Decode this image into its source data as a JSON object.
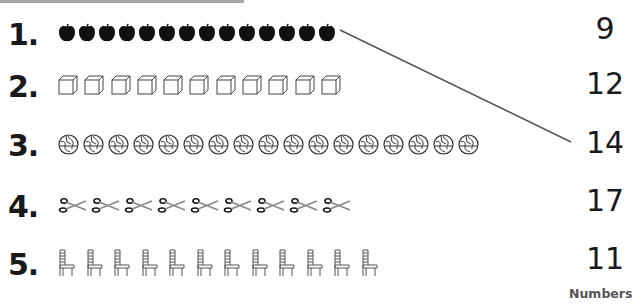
{
  "rows": [
    {
      "label": "1.",
      "object": "apple",
      "count": 14
    },
    {
      "label": "2.",
      "object": "cube",
      "count": 11
    },
    {
      "label": "3.",
      "object": "globe",
      "count": 17
    },
    {
      "label": "4.",
      "object": "scissors",
      "count": 9
    },
    {
      "label": "5.",
      "object": "chair",
      "count": 12
    }
  ],
  "answers": [
    "9",
    "12",
    "14",
    "17",
    "11"
  ],
  "footer_label": "Numbers",
  "matching_line": {
    "from_row": 1,
    "to_answer": "14",
    "color": "#555555"
  },
  "colors": {
    "text": "#1a1a1a",
    "topbar": "#a8a8a8",
    "line": "#555555"
  }
}
